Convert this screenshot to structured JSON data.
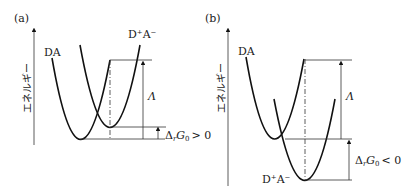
{
  "panels": [
    {
      "label": "(a)",
      "y_axis_label": "エネルギー",
      "curve_labels": {
        "reactant": "DA",
        "product": "D⁺A⁻"
      },
      "lambda_label": "Λ",
      "delta_g_label": "ΔrG0 > 0",
      "delta_g_parts": {
        "delta": "Δ",
        "sub_r": "r",
        "G": "G",
        "sub_0": "0",
        "relation": "> 0"
      }
    },
    {
      "label": "(b)",
      "y_axis_label": "エネルギー",
      "curve_labels": {
        "reactant": "DA",
        "product": "D⁺A⁻"
      },
      "lambda_label": "Λ",
      "delta_g_label": "ΔrG0 < 0",
      "delta_g_parts": {
        "delta": "Δ",
        "sub_r": "r",
        "G": "G",
        "sub_0": "0",
        "relation": "< 0"
      }
    }
  ]
}
